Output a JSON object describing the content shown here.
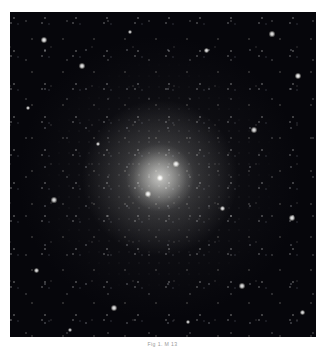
{
  "page": {
    "background_color": "#ffffff",
    "width": 325,
    "height": 350
  },
  "figure": {
    "name": "globular-cluster-photograph",
    "caption": "Fig 1. M 13",
    "caption_color": "#9a9a9a",
    "plate": {
      "background_color": "#06060b",
      "left": 10,
      "top": 12,
      "width": 306,
      "height": 325,
      "core_center_x_pct": 49,
      "core_center_y_pct": 51,
      "core_color": "#e8e8e4",
      "star_color": "#ffffff"
    },
    "bright_stars": [
      {
        "x": 34,
        "y": 28,
        "size": 3.0,
        "opacity": 0.95
      },
      {
        "x": 262,
        "y": 22,
        "size": 2.6,
        "opacity": 0.9
      },
      {
        "x": 288,
        "y": 64,
        "size": 3.2,
        "opacity": 0.98
      },
      {
        "x": 18,
        "y": 96,
        "size": 2.4,
        "opacity": 0.85
      },
      {
        "x": 72,
        "y": 54,
        "size": 2.8,
        "opacity": 0.92
      },
      {
        "x": 196,
        "y": 38,
        "size": 2.5,
        "opacity": 0.88
      },
      {
        "x": 120,
        "y": 20,
        "size": 2.3,
        "opacity": 0.82
      },
      {
        "x": 244,
        "y": 118,
        "size": 2.7,
        "opacity": 0.9
      },
      {
        "x": 44,
        "y": 188,
        "size": 2.6,
        "opacity": 0.88
      },
      {
        "x": 282,
        "y": 206,
        "size": 3.0,
        "opacity": 0.94
      },
      {
        "x": 26,
        "y": 258,
        "size": 2.5,
        "opacity": 0.86
      },
      {
        "x": 104,
        "y": 296,
        "size": 2.9,
        "opacity": 0.92
      },
      {
        "x": 178,
        "y": 310,
        "size": 2.4,
        "opacity": 0.84
      },
      {
        "x": 232,
        "y": 274,
        "size": 2.7,
        "opacity": 0.9
      },
      {
        "x": 292,
        "y": 300,
        "size": 2.5,
        "opacity": 0.86
      },
      {
        "x": 150,
        "y": 166,
        "size": 3.4,
        "opacity": 1.0
      },
      {
        "x": 138,
        "y": 182,
        "size": 2.8,
        "opacity": 0.96
      },
      {
        "x": 166,
        "y": 152,
        "size": 2.6,
        "opacity": 0.94
      },
      {
        "x": 88,
        "y": 132,
        "size": 2.4,
        "opacity": 0.86
      },
      {
        "x": 212,
        "y": 196,
        "size": 2.5,
        "opacity": 0.88
      },
      {
        "x": 60,
        "y": 318,
        "size": 2.3,
        "opacity": 0.8
      },
      {
        "x": 256,
        "y": 330,
        "size": 2.2,
        "opacity": 0.78
      }
    ]
  }
}
